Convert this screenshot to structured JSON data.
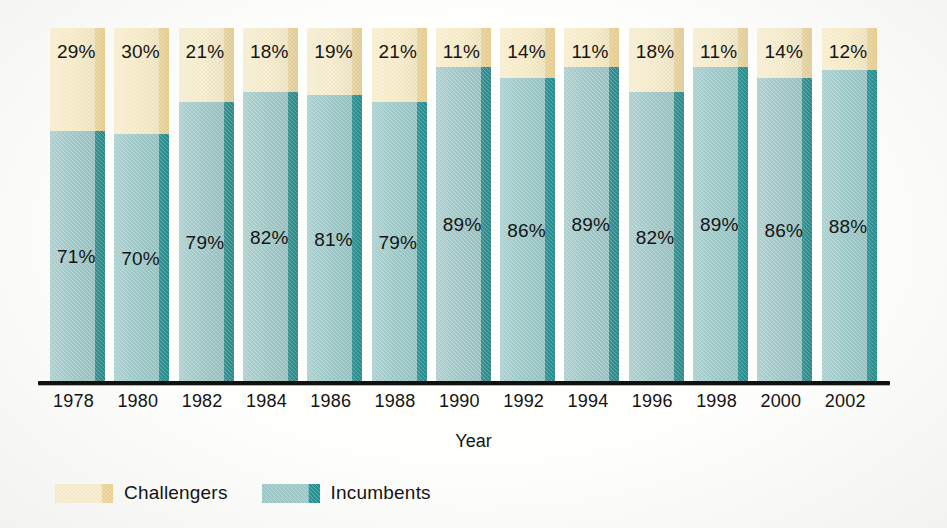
{
  "chart_data": {
    "type": "bar",
    "subtype": "100% stacked vertical bar",
    "title": "",
    "xlabel": "Year",
    "ylabel": "",
    "ylim": [
      0,
      100
    ],
    "grid": false,
    "legend_position": "bottom-left",
    "value_labels": "percent, shown inside each segment",
    "categories": [
      "1978",
      "1980",
      "1982",
      "1984",
      "1986",
      "1988",
      "1990",
      "1992",
      "1994",
      "1996",
      "1998",
      "2000",
      "2002"
    ],
    "series": [
      {
        "name": "Challengers",
        "color": "#f7ecca",
        "side_color": "#efd79a",
        "values": [
          29,
          30,
          21,
          18,
          19,
          21,
          11,
          14,
          11,
          18,
          11,
          14,
          12
        ],
        "labels": [
          "29%",
          "30%",
          "21%",
          "18%",
          "19%",
          "21%",
          "11%",
          "14%",
          "11%",
          "18%",
          "11%",
          "14%",
          "12%"
        ]
      },
      {
        "name": "Incumbents",
        "color": "#9fc9c8",
        "side_color": "#2f9395",
        "values": [
          71,
          70,
          79,
          82,
          81,
          79,
          89,
          86,
          89,
          82,
          89,
          86,
          88
        ],
        "labels": [
          "71%",
          "70%",
          "79%",
          "82%",
          "81%",
          "79%",
          "89%",
          "86%",
          "89%",
          "82%",
          "89%",
          "86%",
          "88%"
        ]
      }
    ]
  },
  "axis": {
    "x_title": "Year",
    "ticks": [
      "1978",
      "1980",
      "1982",
      "1984",
      "1986",
      "1988",
      "1990",
      "1992",
      "1994",
      "1996",
      "1998",
      "2000",
      "2002"
    ]
  },
  "legend": {
    "items": [
      {
        "label": "Challengers",
        "swatch": "challengers"
      },
      {
        "label": "Incumbents",
        "swatch": "incumbents"
      }
    ]
  },
  "colors": {
    "challengers_face": "#f7ecca",
    "challengers_side": "#efd79a",
    "incumbents_face": "#9fc9c8",
    "incumbents_side": "#2f9395",
    "axis": "#111110",
    "text": "#141414",
    "background": "#fefefd"
  }
}
